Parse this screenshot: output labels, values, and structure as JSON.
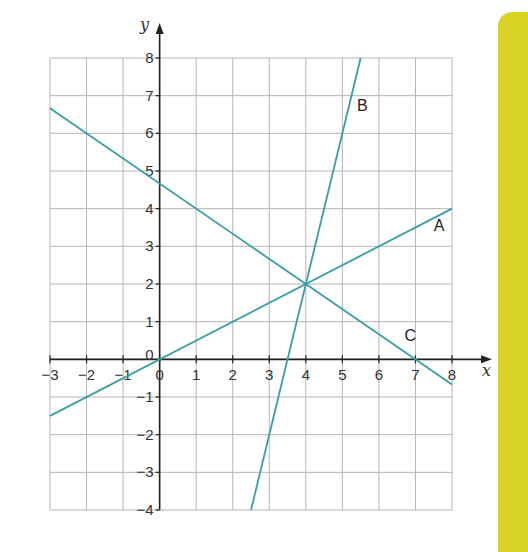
{
  "chart_data": {
    "type": "line",
    "title": "",
    "xlabel": "x",
    "ylabel": "y",
    "xlim": [
      -3,
      8
    ],
    "ylim": [
      -4,
      8
    ],
    "grid": true,
    "x_ticks": [
      -3,
      -2,
      -1,
      0,
      1,
      2,
      3,
      4,
      5,
      6,
      7,
      8
    ],
    "y_ticks": [
      -4,
      -3,
      -2,
      -1,
      0,
      1,
      2,
      3,
      4,
      5,
      6,
      7,
      8
    ],
    "series": [
      {
        "name": "A",
        "equation": "y = x/2",
        "points": [
          [
            -3,
            -1.5
          ],
          [
            8,
            4
          ]
        ],
        "label_pos": [
          7.5,
          3.4
        ]
      },
      {
        "name": "B",
        "equation": "y = 4x - 14",
        "points": [
          [
            2.5,
            -4
          ],
          [
            5.5,
            8
          ]
        ],
        "label_pos": [
          5.4,
          6.6
        ]
      },
      {
        "name": "C",
        "equation": "y = -2x/3 + 14/3",
        "points": [
          [
            -3,
            6.667
          ],
          [
            8,
            -0.667
          ]
        ],
        "label_pos": [
          6.7,
          0.5
        ]
      }
    ],
    "intersection": [
      4,
      2
    ],
    "line_color": "#3a9ea5"
  },
  "labels": {
    "x_axis": "x",
    "y_axis": "y",
    "line_a": "A",
    "line_b": "B",
    "line_c": "C"
  },
  "colors": {
    "line": "#3a9ea5",
    "grid": "#b5b5b5",
    "axis": "#222222",
    "panel": "#d9d326"
  }
}
